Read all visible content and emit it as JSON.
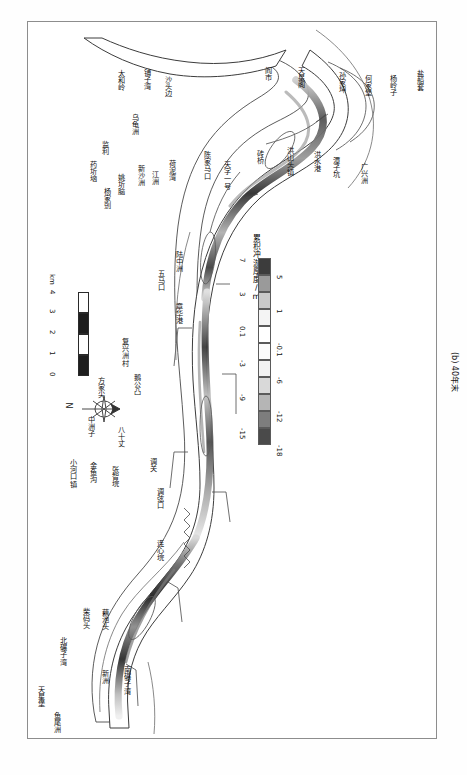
{
  "figure": {
    "caption": "(b) 40年末",
    "orientation_note": "rotated-90",
    "frame_color": "#8d8d8d"
  },
  "legend": {
    "title": "累积冲淤厚度/m",
    "unit": "m",
    "ticks": [
      "-18",
      "-15",
      "-12",
      "-9",
      "-6",
      "-3",
      "-0.1",
      "0.1",
      "1",
      "3",
      "5",
      "7"
    ],
    "bins": [
      {
        "from": "-18",
        "to": "-15",
        "color": "#4a4a4a"
      },
      {
        "from": "-15",
        "to": "-12",
        "color": "#7d7d7d"
      },
      {
        "from": "-12",
        "to": "-9",
        "color": "#b5b5b5"
      },
      {
        "from": "-9",
        "to": "-6",
        "color": "#d9d9d9"
      },
      {
        "from": "-6",
        "to": "-3",
        "color": "#f2f2f2"
      },
      {
        "from": "-3",
        "to": "-0.1",
        "color": "#fbfbfb"
      },
      {
        "from": "-0.1",
        "to": "0.1",
        "color": "#ffffff"
      },
      {
        "from": "0.1",
        "to": "1",
        "color": "#f4f4f4"
      },
      {
        "from": "1",
        "to": "3",
        "color": "#c9c9c9"
      },
      {
        "from": "3",
        "to": "5",
        "color": "#9a9a9a"
      },
      {
        "from": "5",
        "to": "7",
        "color": "#3c3c3c"
      }
    ]
  },
  "scalebar": {
    "labels": [
      "0",
      "1",
      "2",
      "3",
      "4"
    ],
    "unit": "km",
    "segments": 4
  },
  "north_arrow": {
    "label": "N"
  },
  "place_labels": [
    {
      "id": "jianli",
      "text": "监利"
    },
    {
      "id": "taiheling",
      "text": "太和岭"
    },
    {
      "id": "puziwan",
      "text": "铺子湾"
    },
    {
      "id": "shatoubian",
      "text": "沙头边"
    },
    {
      "id": "wuguizhou",
      "text": "乌龟洲"
    },
    {
      "id": "yaoqinao",
      "text": "姚圻脑"
    },
    {
      "id": "yangjialiu",
      "text": "杨家剅"
    },
    {
      "id": "yaozhuwan",
      "text": "药圻垴"
    },
    {
      "id": "xinshazhou",
      "text": "新沙洲"
    },
    {
      "id": "jiangzhou",
      "text": "江洲"
    },
    {
      "id": "henniwan",
      "text": "荷泥湾"
    },
    {
      "id": "luzhongzhou",
      "text": "陆中洲"
    },
    {
      "id": "wumakou",
      "text": "五马口"
    },
    {
      "id": "zhanghuagang",
      "text": "章华港"
    },
    {
      "id": "chenjiamakou",
      "text": "陈家马口"
    },
    {
      "id": "tianziyihao",
      "text": "天字一号"
    },
    {
      "id": "yanshi",
      "text": "阎市"
    },
    {
      "id": "tianxingge",
      "text": "天星阁"
    },
    {
      "id": "zhuanqiao",
      "text": "砖桥"
    },
    {
      "id": "hongshantouzhen",
      "text": "洪山头镇"
    },
    {
      "id": "hongshuigang",
      "text": "洪水港"
    },
    {
      "id": "sunjiaqu",
      "text": "孙家坤"
    },
    {
      "id": "hejiabao",
      "text": "何家堡"
    },
    {
      "id": "tanzikeng",
      "text": "潭子坑"
    },
    {
      "id": "yanglingzi",
      "text": "杨岭子"
    },
    {
      "id": "guangxingzhou",
      "text": "广兴洲"
    },
    {
      "id": "yanchuantao",
      "text": "盐船套"
    },
    {
      "id": "epgongzhan",
      "text": "鹅公凸"
    },
    {
      "id": "fuxingzhoucun",
      "text": "复兴洲村"
    },
    {
      "id": "fangjiajian",
      "text": "方家尖"
    },
    {
      "id": "zhongzhouzi",
      "text": "中洲子"
    },
    {
      "id": "bashizhang",
      "text": "八十丈"
    },
    {
      "id": "jinyugou",
      "text": "金鱼沟"
    },
    {
      "id": "zhangzhiyuan",
      "text": "张智垸"
    },
    {
      "id": "diaoguan",
      "text": "调关"
    },
    {
      "id": "diaoxiankou",
      "text": "调弦口"
    },
    {
      "id": "xiaohekouzhen",
      "text": "小河口镇"
    },
    {
      "id": "lianxinyuan",
      "text": "连心垸"
    },
    {
      "id": "chaimatou",
      "text": "柴码头"
    },
    {
      "id": "oucitou",
      "text": "藕池头"
    },
    {
      "id": "beiniaanzi",
      "text": "北碾子湾"
    },
    {
      "id": "xinzhou",
      "text": "新洲"
    },
    {
      "id": "nanniaanzi",
      "text": "南碾子湾"
    },
    {
      "id": "tianxingbao",
      "text": "天星堡"
    },
    {
      "id": "yuweizhou",
      "text": "鱼尾洲"
    }
  ]
}
